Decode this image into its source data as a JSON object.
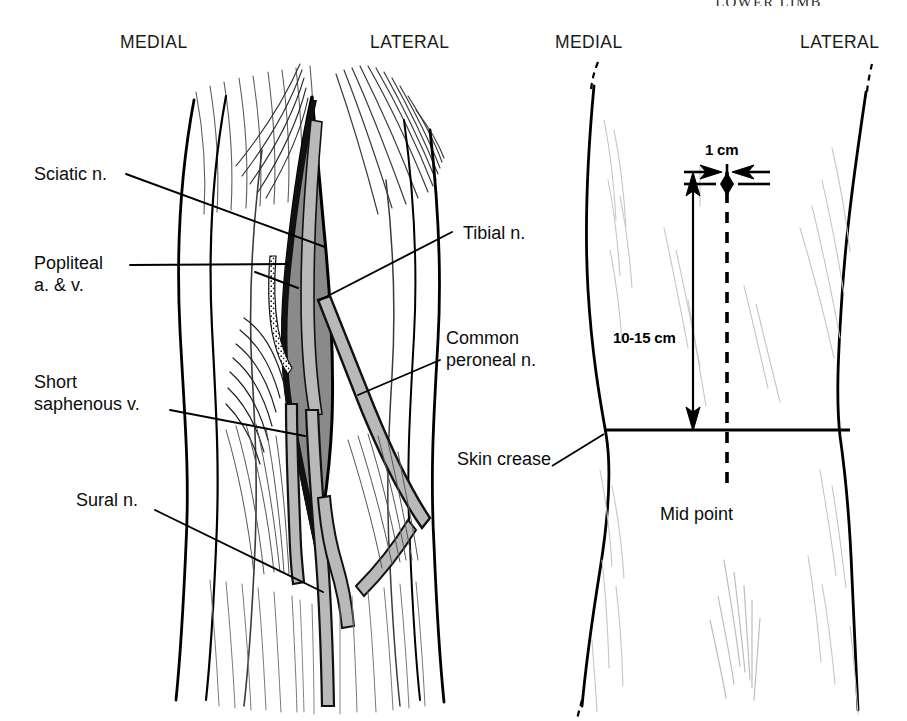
{
  "page": {
    "running_head": "LOWER LIMB",
    "width": 907,
    "height": 721,
    "background": "#ffffff",
    "ink": "#000000"
  },
  "colors": {
    "outline": "#000000",
    "fossa_fill": "#8a8a8a",
    "nerve_fill": "#b9b9b9",
    "muscle_hatch": "#1a1a1a",
    "faint_hatch": "#c9c9c9"
  },
  "figures": [
    {
      "id": "dissection",
      "name": "popliteal-fossa-dissection",
      "orientation": {
        "left": "MEDIAL",
        "right": "LATERAL"
      },
      "labels": [
        {
          "id": "sciatic",
          "text": "Sciatic n.",
          "lines": [
            "Sciatic n."
          ]
        },
        {
          "id": "popliteal-av",
          "text": "Popliteal a. & v.",
          "lines": [
            "Popliteal",
            "a. & v."
          ]
        },
        {
          "id": "short-saphenous",
          "text": "Short saphenous v.",
          "lines": [
            "Short",
            "saphenous v."
          ]
        },
        {
          "id": "sural",
          "text": "Sural n.",
          "lines": [
            "Sural n."
          ]
        },
        {
          "id": "tibial",
          "text": "Tibial n.",
          "lines": [
            "Tibial n."
          ]
        },
        {
          "id": "common-peroneal",
          "text": "Common peroneal n.",
          "lines": [
            "Common",
            "peroneal  n."
          ]
        }
      ]
    },
    {
      "id": "surface",
      "name": "surface-landmarks",
      "orientation": {
        "left": "MEDIAL",
        "right": "LATERAL"
      },
      "labels": [
        {
          "id": "skin-crease",
          "text": "Skin crease",
          "lines": [
            "Skin crease"
          ]
        },
        {
          "id": "mid-point",
          "text": "Mid point",
          "lines": [
            "Mid point"
          ]
        }
      ],
      "measurements": [
        {
          "id": "lateral-offset",
          "text": "1 cm",
          "axis": "horizontal"
        },
        {
          "id": "crease-distance",
          "text": "10-15 cm",
          "axis": "vertical"
        }
      ]
    }
  ],
  "orientation_headers": [
    {
      "id": "medial-left",
      "text": "MEDIAL"
    },
    {
      "id": "lateral-left",
      "text": "LATERAL"
    },
    {
      "id": "medial-right",
      "text": "MEDIAL"
    },
    {
      "id": "lateral-right",
      "text": "LATERAL"
    }
  ]
}
